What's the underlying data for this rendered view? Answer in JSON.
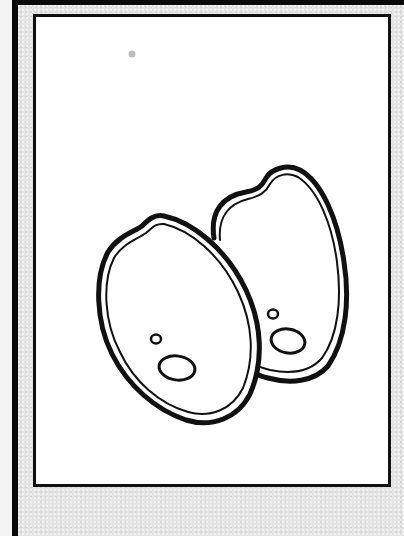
{
  "image": {
    "subject": "two rice grains / seeds line-art coloring page",
    "elements": [
      {
        "name": "back-grain",
        "description": "seed outline, rear right"
      },
      {
        "name": "front-grain",
        "description": "seed outline, front left"
      },
      {
        "name": "stray-dot",
        "description": "faint gray speck near top-left"
      }
    ]
  },
  "colors": {
    "frame_border": "#0a0a0a",
    "frame_fill": "#e4e4e4",
    "panel_fill": "#ffffff",
    "line": "#111111",
    "speck": "#bdbdbd"
  }
}
